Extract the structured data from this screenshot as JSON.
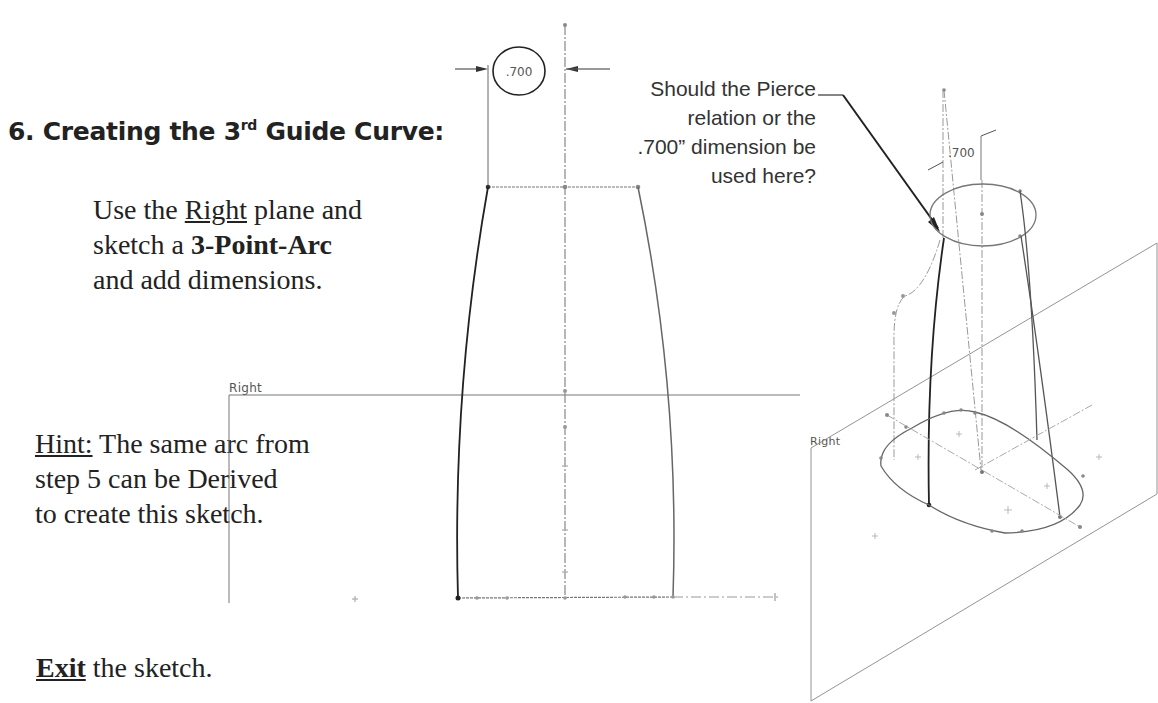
{
  "heading": {
    "number": "6.",
    "text_before": "Creating the 3",
    "superscript": "rd",
    "text_after": " Guide Curve:"
  },
  "instruction": {
    "line1_prefix": "Use the ",
    "line1_link": "Right",
    "line1_suffix": " plane and",
    "line2_prefix": "sketch a ",
    "line2_bold": "3-Point-Arc",
    "line3": "and add dimensions."
  },
  "hint": {
    "label": "Hint:",
    "line1_rest": " The same arc from",
    "line2": "step 5 can be Derived",
    "line3": "to create this sketch."
  },
  "exit": {
    "bold": "Exit",
    "rest": " the sketch."
  },
  "callout": {
    "lines": [
      "Should the Pierce",
      "relation or the",
      ".700” dimension be",
      "used here?"
    ]
  },
  "sketch_2d": {
    "plane_label": "Right",
    "dimension_value": ".700"
  },
  "view_3d": {
    "plane_label": "Right",
    "dimension_value": ".700"
  },
  "colors": {
    "text": "#222222",
    "line": "#555555",
    "light_line": "#888888"
  }
}
